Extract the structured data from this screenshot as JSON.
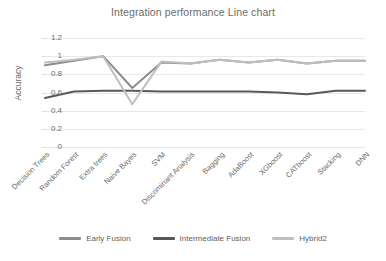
{
  "chart_data": {
    "type": "line",
    "title": "Integration performance Line chart",
    "xlabel": "",
    "ylabel": "Accuracy",
    "ylim": [
      0,
      1.2
    ],
    "ytick_labels": [
      "1.2",
      "1",
      "0.8",
      "0.6",
      "0.4",
      "0.2",
      "0"
    ],
    "ytick_values": [
      1.2,
      1,
      0.8,
      0.6,
      0.4,
      0.2,
      0
    ],
    "grid": true,
    "legend_position": "bottom",
    "categories": [
      "Decision Trees",
      "Random Forest",
      "Extra trees",
      "Naive Bayes",
      "SVM",
      "Discriminant Analysis",
      "Bagging",
      "AdaBoost",
      "XGboost",
      "CATboost",
      "Stacking",
      "DNN"
    ],
    "series": [
      {
        "name": "Early Fusion",
        "color": "#8c8c8c",
        "values": [
          0.9,
          0.95,
          1.0,
          0.65,
          0.93,
          0.92,
          0.96,
          0.93,
          0.96,
          0.92,
          0.95,
          0.95
        ]
      },
      {
        "name": "Intermediate Fusion",
        "color": "#595959",
        "values": [
          0.54,
          0.61,
          0.62,
          0.62,
          0.61,
          0.61,
          0.61,
          0.61,
          0.6,
          0.58,
          0.62,
          0.62
        ]
      },
      {
        "name": "Hybrid2",
        "color": "#bfbfbf",
        "values": [
          0.93,
          0.96,
          1.0,
          0.47,
          0.94,
          0.92,
          0.96,
          0.93,
          0.96,
          0.92,
          0.95,
          0.95
        ]
      }
    ]
  },
  "legend": {
    "items": [
      {
        "label": "Early Fusion",
        "color": "#8c8c8c"
      },
      {
        "label": "Intermediate Fusion",
        "color": "#595959"
      },
      {
        "label": "Hybrid2",
        "color": "#bfbfbf"
      }
    ]
  }
}
